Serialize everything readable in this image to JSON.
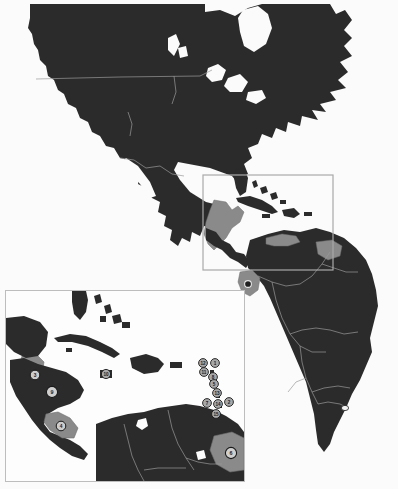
{
  "figure": {
    "type": "map",
    "background_color": "#fbfbfb",
    "land_color": "#2b2b2b",
    "highlight_color": "#8a8a8a",
    "border_color": "#9a9a9a",
    "water_color": "#fbfbfb",
    "frame_color": "#bdbdbd",
    "marker_fill": "#9a9a9a",
    "marker_stroke": "#1a1a1a",
    "marker_text_color": "#1a1a1a"
  },
  "main_map": {
    "name": "americas-overview",
    "extent_label": "North and South America",
    "locator_box": {
      "name": "caribbean-locator-box",
      "x": 203,
      "y": 175,
      "width": 130,
      "height": 95
    },
    "markers": [
      {
        "id": "ecuador",
        "label": "",
        "x": 248,
        "y": 284
      },
      {
        "id": "southeast-brazil",
        "label": "",
        "x": 345,
        "y": 408
      }
    ],
    "highlight_regions": [
      {
        "id": "mexico-central-america",
        "label": ""
      },
      {
        "id": "ecuador-highlight",
        "label": ""
      },
      {
        "id": "guyana-suriname-highlight",
        "label": ""
      },
      {
        "id": "colombia-venezuela-coast",
        "label": ""
      }
    ]
  },
  "inset_map": {
    "name": "caribbean-inset",
    "frame": {
      "x": 5,
      "y": 290,
      "width": 240,
      "height": 192
    },
    "markers": [
      {
        "label": "12",
        "x": 203,
        "y": 363
      },
      {
        "label": "1",
        "x": 215,
        "y": 363
      },
      {
        "label": "11",
        "x": 204,
        "y": 372
      },
      {
        "label": "5",
        "x": 214,
        "y": 381
      },
      {
        "label": "8",
        "x": 213,
        "y": 377
      },
      {
        "label": "13",
        "x": 217,
        "y": 391
      },
      {
        "label": "7",
        "x": 207,
        "y": 402
      },
      {
        "label": "14",
        "x": 218,
        "y": 403
      },
      {
        "label": "2",
        "x": 229,
        "y": 401
      },
      {
        "label": "15",
        "x": 216,
        "y": 413
      },
      {
        "label": "10",
        "x": 106,
        "y": 374
      },
      {
        "label": "3",
        "x": 35,
        "y": 375
      },
      {
        "label": "9",
        "x": 50,
        "y": 392
      },
      {
        "label": "4",
        "x": 60,
        "y": 425
      },
      {
        "label": "6",
        "x": 230,
        "y": 453
      }
    ],
    "highlight_regions": [
      {
        "id": "belize-guatemala",
        "label": ""
      },
      {
        "id": "honduras-nicaragua",
        "label": ""
      },
      {
        "id": "costa-rica-panama",
        "label": ""
      },
      {
        "id": "guyana-suriname",
        "label": ""
      },
      {
        "id": "lesser-antilles",
        "label": ""
      }
    ]
  }
}
